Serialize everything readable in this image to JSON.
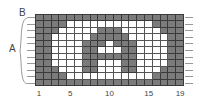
{
  "diagram": {
    "labels": {
      "a": "A",
      "b": "B"
    },
    "columns": 19,
    "rows": 11,
    "x_tick_labels": [
      {
        "col": 1,
        "text": "1"
      },
      {
        "col": 5,
        "text": "5"
      },
      {
        "col": 10,
        "text": "10"
      },
      {
        "col": 15,
        "text": "15"
      },
      {
        "col": 19,
        "text": "19"
      }
    ],
    "colors": {
      "dark": "#7b7b7b",
      "light": "#ffffff",
      "grid_line": "#3a3a3a"
    },
    "pattern": [
      "1111111111111111111",
      "1111000000000001111",
      "1110000011100000111",
      "1100000111110000011",
      "1100001110111000011",
      "1100001100011000011",
      "1100001111111000011",
      "1100001100011000011",
      "1110001100011000111",
      "1111000000000001111",
      "1111111111111111111"
    ]
  }
}
